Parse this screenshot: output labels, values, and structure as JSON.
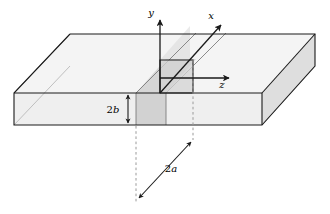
{
  "figure": {
    "background_color": "#ffffff",
    "line_color": "#1a1a1a",
    "fill_top": "#f2f2f2",
    "fill_front": "#ededed",
    "fill_side": "#e0e0e0",
    "fill_core": "#cfcfcf",
    "dashed_color": "#8a8a8a"
  },
  "axes": {
    "y": {
      "label": "y",
      "direction": "up",
      "arrow": true
    },
    "x": {
      "label": "x",
      "direction": "up-right",
      "arrow": true
    },
    "z": {
      "label": "z",
      "direction": "right",
      "arrow": true
    },
    "origin_name": "coordinate-origin"
  },
  "dimensions": [
    {
      "name": "thickness",
      "prefix": "2",
      "variable": "b",
      "label": "2b",
      "orientation": "vertical",
      "arrow_style": "double-headed"
    },
    {
      "name": "width",
      "prefix": "2",
      "variable": "a",
      "label": "2a",
      "orientation": "diagonal",
      "arrow_style": "double-headed"
    }
  ],
  "guides": [
    {
      "name": "left-extension-line",
      "style": "dashed",
      "orientation": "vertical"
    },
    {
      "name": "right-extension-line",
      "style": "dashed",
      "orientation": "vertical"
    }
  ]
}
